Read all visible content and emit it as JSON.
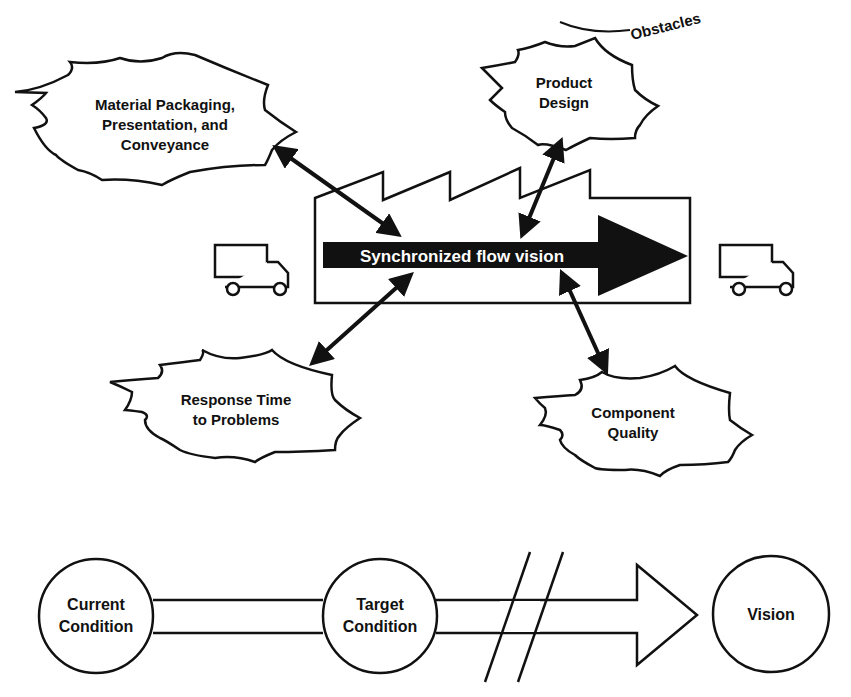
{
  "obstacles_label": "Obstacles",
  "main_arrow_label": "Synchronized flow vision",
  "obstacles": [
    {
      "line1": "Material Packaging,",
      "line2": "Presentation, and",
      "line3": "Conveyance"
    },
    {
      "line1": "Product",
      "line2": "Design"
    },
    {
      "line1": "Response Time",
      "line2": "to Problems"
    },
    {
      "line1": "Component",
      "line2": "Quality"
    }
  ],
  "conditions": [
    {
      "line1": "Current",
      "line2": "Condition"
    },
    {
      "line1": "Target",
      "line2": "Condition"
    },
    {
      "line1": "Vision"
    }
  ],
  "colors": {
    "ink": "#111111",
    "background": "#ffffff"
  }
}
